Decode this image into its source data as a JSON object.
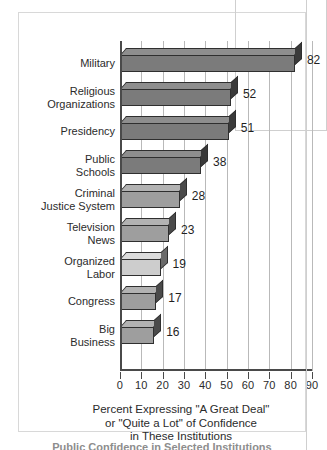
{
  "chart_data": {
    "type": "bar",
    "orientation": "horizontal",
    "title": "",
    "xlabel": "Percent Expressing \"A Great Deal\" or \"Quite a Lot\" of Confidence in These Institutions",
    "ylabel": "",
    "xlim": [
      0,
      90
    ],
    "xticks": [
      0,
      10,
      20,
      30,
      40,
      50,
      60,
      70,
      80,
      90
    ],
    "grid": true,
    "legend": "none",
    "categories": [
      "Military",
      "Religious Organizations",
      "Presidency",
      "Public Schools",
      "Criminal Justice System",
      "Television News",
      "Organized Labor",
      "Congress",
      "Big Business"
    ],
    "values": [
      82,
      52,
      51,
      38,
      28,
      23,
      19,
      17,
      16
    ],
    "bars": [
      {
        "label_line1": "Military",
        "label_line2": "",
        "value": 82,
        "shade": "dark"
      },
      {
        "label_line1": "Religious",
        "label_line2": "Organizations",
        "value": 52,
        "shade": "dark"
      },
      {
        "label_line1": "Presidency",
        "label_line2": "",
        "value": 51,
        "shade": "dark"
      },
      {
        "label_line1": "Public",
        "label_line2": "Schools",
        "value": 38,
        "shade": "dark"
      },
      {
        "label_line1": "Criminal",
        "label_line2": "Justice System",
        "value": 28,
        "shade": "mid"
      },
      {
        "label_line1": "Television",
        "label_line2": "News",
        "value": 23,
        "shade": "mid"
      },
      {
        "label_line1": "Organized",
        "label_line2": "Labor",
        "value": 19,
        "shade": "light"
      },
      {
        "label_line1": "Congress",
        "label_line2": "",
        "value": 17,
        "shade": "mid"
      },
      {
        "label_line1": "Big",
        "label_line2": "Business",
        "value": 16,
        "shade": "mid"
      }
    ]
  },
  "caption": {
    "line1": "Percent Expressing \"A Great Deal\"",
    "line2": "or \"Quite a Lot\" of Confidence",
    "line3": "in These Institutions"
  },
  "undertitle": {
    "text": "Public Confidence in Selected Institutions"
  },
  "colors": {
    "bar_dark": "#7b7b7b",
    "bar_mid": "#9e9e9e",
    "bar_light": "#cdcdcd",
    "axis": "#4a4a4a",
    "grid": "#b9b9b9",
    "text": "#2b2b2b",
    "panel_border": "#d8d8d8"
  }
}
